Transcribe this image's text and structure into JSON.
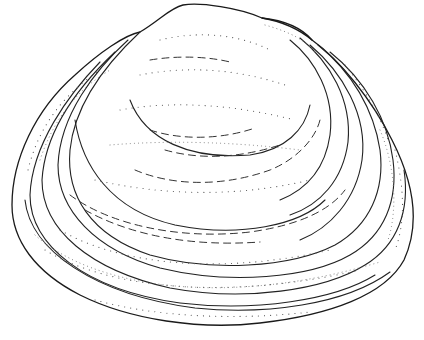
{
  "illustration": {
    "subject": "bivalve clam shell (line drawing with stippling)",
    "style": "black ink on white",
    "colors": {
      "ink": "#1a1a1a",
      "background": "#ffffff"
    }
  }
}
